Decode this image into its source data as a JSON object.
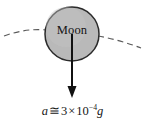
{
  "figure": {
    "canvas": {
      "width": 145,
      "height": 135,
      "background": "#ffffff"
    },
    "body": {
      "label": "Moon",
      "shape": "circle",
      "fill_color": "#b9b9b9",
      "stroke_color": "#2b2b2b",
      "center_x": 72,
      "center_y": 34,
      "radius": 27
    },
    "orbit_path": {
      "name": "dashed-orbit-arc",
      "style": "dashed",
      "color": "#555555",
      "description": "dashed orbital arc passing horizontally through the Moon"
    },
    "acceleration_arrow": {
      "name": "acceleration-vector",
      "direction": "down",
      "color": "#111111",
      "start_y": 34,
      "end_y": 97
    },
    "equation": {
      "variable": "a",
      "relation": "≅",
      "coefficient": "3",
      "times": "×",
      "base": "10",
      "exponent": "−4",
      "unit": "g",
      "full_text": "a ≅ 3 × 10−4g"
    }
  }
}
